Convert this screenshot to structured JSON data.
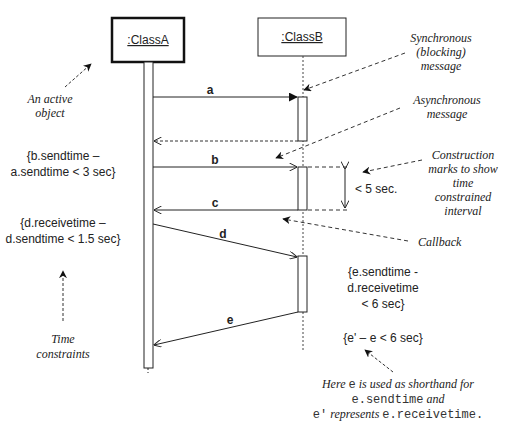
{
  "objects": {
    "classA": {
      "label": ":ClassA",
      "active": true
    },
    "classB": {
      "label": ":ClassB",
      "active": false
    }
  },
  "messages": [
    {
      "id": "a",
      "label": "a",
      "kind": "synchronous"
    },
    {
      "id": "a_return",
      "label": "",
      "kind": "return"
    },
    {
      "id": "b",
      "label": "b",
      "kind": "asynchronous"
    },
    {
      "id": "c",
      "label": "c",
      "kind": "callback"
    },
    {
      "id": "d",
      "label": "d",
      "kind": "asynchronous-delayed"
    },
    {
      "id": "e",
      "label": "e",
      "kind": "asynchronous-delayed"
    }
  ],
  "constraints": {
    "b_minus_a": {
      "line1": "{b.sendtime –",
      "line2": "a.sendtime < 3 sec}"
    },
    "d_receive_minus_send": {
      "line1": "{d.receivetime –",
      "line2": "d.sendtime < 1.5 sec}"
    },
    "e_minus_d": {
      "line1": "{e.sendtime -",
      "line2": "d.receivetime",
      "line3": "< 6 sec}"
    },
    "e_prime_minus_e": "{e' – e < 6 sec}",
    "interval": "< 5 sec."
  },
  "annotations": {
    "active_object": {
      "line1": "An active",
      "line2": "object"
    },
    "synchronous": {
      "line1": "Synchronous",
      "line2": "(blocking)",
      "line3": "message"
    },
    "asynchronous": {
      "line1": "Asynchronous",
      "line2": "message"
    },
    "construction": {
      "line1": "Construction",
      "line2": "marks to show",
      "line3": "time",
      "line4": "constrained",
      "line5": "interval"
    },
    "callback": "Callback",
    "time_constraints": {
      "line1": "Time",
      "line2": "constraints"
    },
    "shorthand": {
      "line1_italic": "Here ",
      "line1_mono": "e",
      "line1_rest": " is used as shorthand for",
      "line2_mono": "e.sendtime",
      "line2_italic": " and",
      "line3_mono1": "e'",
      "line3_italic": " represents ",
      "line3_mono2": "e.receivetime."
    }
  },
  "colors": {
    "line": "#222222",
    "text": "#222222",
    "background": "#ffffff"
  }
}
